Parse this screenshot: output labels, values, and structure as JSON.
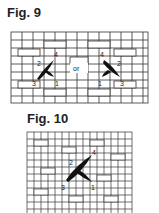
{
  "figures": [
    {
      "title": "Fig. 9",
      "separator": "or",
      "left_stitch_labels": [
        "1",
        "2",
        "3",
        "4"
      ],
      "right_stitch_labels": [
        "1",
        "2",
        "3",
        "4"
      ]
    },
    {
      "title": "Fig. 10",
      "stitch_labels": [
        "1",
        "2",
        "3",
        "4"
      ]
    }
  ],
  "colors": {
    "line": "#333333",
    "stitch": "#111111",
    "background": "#ffffff"
  }
}
